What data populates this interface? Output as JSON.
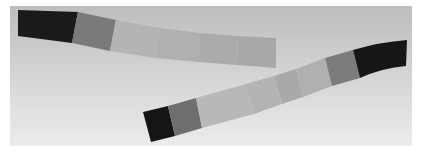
{
  "image": {
    "description": "Photograph of two curved grayscale step strips on a light gray gradient background",
    "background": {
      "top": "#bdbdbd",
      "bottom": "#ececec"
    },
    "strips": [
      {
        "name": "upper-strip",
        "segments": [
          {
            "tone": "black",
            "color": "#1a1a1a"
          },
          {
            "tone": "dark-gray",
            "color": "#7a7a7a"
          },
          {
            "tone": "light-gray",
            "color": "#b4b4b4"
          },
          {
            "tone": "light-gray",
            "color": "#b0b0b0"
          },
          {
            "tone": "light-gray",
            "color": "#ababab"
          },
          {
            "tone": "light-gray",
            "color": "#a8a8a8"
          }
        ]
      },
      {
        "name": "lower-strip",
        "segments": [
          {
            "tone": "black",
            "color": "#151515"
          },
          {
            "tone": "dark-gray",
            "color": "#6e6e6e"
          },
          {
            "tone": "light-gray",
            "color": "#b8b8b8"
          },
          {
            "tone": "light-gray",
            "color": "#b3b3b3"
          },
          {
            "tone": "light-gray",
            "color": "#a9a9a9"
          },
          {
            "tone": "light-gray",
            "color": "#b0b0b0"
          },
          {
            "tone": "dark-gray",
            "color": "#7c7c7c"
          },
          {
            "tone": "black",
            "color": "#161616"
          }
        ]
      }
    ]
  }
}
